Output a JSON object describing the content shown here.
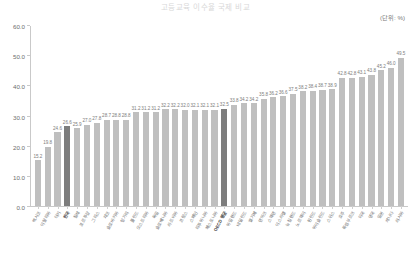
{
  "chart": {
    "title": "고등교육 이수율 국제 비교",
    "unit_label": "(단위: %)"
  },
  "chart_data": {
    "type": "bar",
    "title": "고등교육 이수율 국제 비교",
    "xlabel": "",
    "ylabel": "",
    "ylim": [
      0.0,
      60.0
    ],
    "ytick_labels": [
      "0.0",
      "10.0",
      "20.0",
      "30.0",
      "40.0",
      "50.0",
      "60.0"
    ],
    "yticks": [
      0.0,
      10.0,
      20.0,
      30.0,
      40.0,
      50.0,
      60.0
    ],
    "grid": false,
    "legend": "none",
    "unit": "(단위: %)",
    "highlight_color": "#7d7d7d",
    "bar_color": "#bfbfbf",
    "categories": [
      "멕시코",
      "이탈리아",
      "터키",
      "한국",
      "칠레",
      "포르투갈",
      "그리스",
      "체코",
      "슬로바키아",
      "헝가리",
      "폴란드",
      "오스트리아",
      "독일",
      "슬로베니아",
      "라트비아",
      "프랑스",
      "스페인",
      "리투아니아",
      "에스토니아",
      "OECD 평균",
      "아일랜드",
      "네덜란드",
      "벨기에",
      "덴마크",
      "스웨덴",
      "이스라엘",
      "뉴질랜드",
      "노르웨이",
      "핀란드",
      "아이슬란드",
      "스위스",
      "호주",
      "룩셈부르크",
      "미국",
      "영국",
      "일본",
      "캐나다",
      "러시아"
    ],
    "values": [
      15.2,
      19.8,
      24.6,
      26.6,
      25.9,
      27.0,
      27.8,
      28.7,
      28.8,
      28.8,
      31.2,
      31.2,
      31.2,
      32.2,
      32.2,
      32.0,
      32.1,
      32.1,
      32.1,
      32.5,
      33.8,
      34.2,
      34.2,
      35.8,
      36.2,
      36.6,
      37.5,
      38.2,
      38.4,
      38.7,
      38.9,
      42.8,
      42.8,
      43.1,
      43.8,
      45.2,
      46.0,
      49.5
    ],
    "highlighted_indices": [
      3,
      19
    ],
    "value_labels": [
      "15.2",
      "19.8",
      "24.6",
      "26.6",
      "25.9",
      "27.0",
      "27.8",
      "28.7",
      "28.8",
      "28.8",
      "31.2",
      "31.2",
      "31.2",
      "32.2",
      "32.2",
      "32.0",
      "32.1",
      "32.1",
      "32.1",
      "32.5",
      "33.8",
      "34.2",
      "34.2",
      "35.8",
      "36.2",
      "36.6",
      "37.5",
      "38.2",
      "38.4",
      "38.7",
      "38.9",
      "42.8",
      "42.8",
      "43.1",
      "43.8",
      "45.2",
      "46.0",
      "49.5"
    ]
  }
}
